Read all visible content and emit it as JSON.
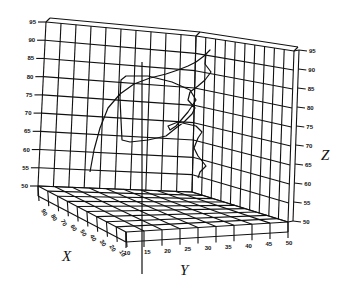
{
  "chart_data": {
    "type": "line3d",
    "title": "",
    "xlabel": "X",
    "ylabel": "Y",
    "zlabel": "Z",
    "x_ticks": [
      90,
      80,
      70,
      60,
      50,
      40,
      30,
      20,
      10
    ],
    "y_ticks": [
      10,
      15,
      20,
      25,
      30,
      35,
      40,
      45,
      50
    ],
    "z_ticks": [
      50,
      55,
      60,
      65,
      70,
      75,
      80,
      85,
      90,
      95
    ],
    "xlim": [
      10,
      90
    ],
    "ylim": [
      10,
      50
    ],
    "zlim": [
      50,
      95
    ],
    "grid": true,
    "series": [
      {
        "name": "trajectory",
        "points_px": [
          [
            90,
            172
          ],
          [
            94,
            150
          ],
          [
            100,
            128
          ],
          [
            108,
            108
          ],
          [
            120,
            94
          ],
          [
            134,
            84
          ],
          [
            150,
            78
          ],
          [
            166,
            74
          ],
          [
            178,
            70
          ],
          [
            188,
            66
          ],
          [
            196,
            62
          ],
          [
            204,
            56
          ],
          [
            210,
            50
          ],
          [
            206,
            54
          ],
          [
            205,
            64
          ],
          [
            211,
            72
          ],
          [
            205,
            80
          ],
          [
            198,
            86
          ],
          [
            190,
            92
          ],
          [
            188,
            100
          ],
          [
            195,
            108
          ],
          [
            192,
            114
          ],
          [
            184,
            122
          ],
          [
            176,
            128
          ],
          [
            166,
            136
          ],
          [
            148,
            140
          ],
          [
            130,
            142
          ],
          [
            122,
            140
          ],
          [
            121,
            120
          ],
          [
            120,
            98
          ],
          [
            121,
            80
          ],
          [
            126,
            76
          ],
          [
            148,
            76
          ],
          [
            172,
            82
          ],
          [
            190,
            90
          ],
          [
            196,
            100
          ],
          [
            188,
            112
          ],
          [
            176,
            126
          ],
          [
            170,
            130
          ],
          [
            168,
            126
          ],
          [
            178,
            122
          ],
          [
            196,
            126
          ],
          [
            202,
            132
          ],
          [
            198,
            138
          ],
          [
            194,
            148
          ],
          [
            198,
            156
          ],
          [
            206,
            166
          ],
          [
            200,
            172
          ],
          [
            198,
            178
          ]
        ]
      },
      {
        "name": "vertical-line",
        "points_px": [
          [
            142,
            62
          ],
          [
            142,
            274
          ]
        ]
      }
    ]
  }
}
